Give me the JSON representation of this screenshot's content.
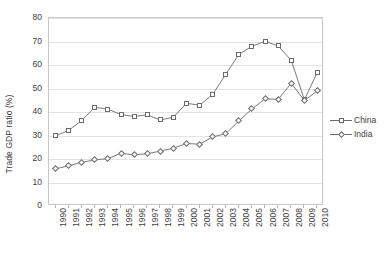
{
  "chart_data": {
    "type": "line",
    "title": "",
    "xlabel": "",
    "ylabel": "Trade GDP ratio (%)",
    "ylim": [
      0,
      80
    ],
    "yticks": [
      0,
      10,
      20,
      30,
      40,
      50,
      60,
      70,
      80
    ],
    "grid": true,
    "legend_position": "right",
    "categories": [
      "1990",
      "1991",
      "1992",
      "1993",
      "1994",
      "1995",
      "1996",
      "1997",
      "1998",
      "1999",
      "2000",
      "2001",
      "2002",
      "2003",
      "2004",
      "2005",
      "2006",
      "2007",
      "2008",
      "2009",
      "2010"
    ],
    "series": [
      {
        "name": "China",
        "marker": "square",
        "color": "#6b6b6b",
        "values": [
          29.8,
          32.2,
          36.4,
          42.0,
          41.2,
          38.9,
          38.1,
          38.8,
          36.6,
          37.8,
          43.7,
          42.9,
          47.5,
          56.1,
          64.5,
          68.0,
          70.1,
          68.1,
          62.0,
          45.2,
          57.0
        ]
      },
      {
        "name": "India",
        "marker": "diamond",
        "color": "#6b6b6b",
        "values": [
          15.8,
          17.1,
          18.6,
          19.6,
          20.2,
          22.4,
          21.8,
          22.2,
          23.4,
          24.6,
          26.6,
          26.3,
          29.4,
          30.8,
          36.2,
          41.3,
          45.6,
          45.4,
          52.2,
          44.9,
          49.0
        ]
      }
    ]
  },
  "legend": {
    "items": [
      {
        "label": "China",
        "marker": "square"
      },
      {
        "label": "India",
        "marker": "diamond"
      }
    ]
  }
}
